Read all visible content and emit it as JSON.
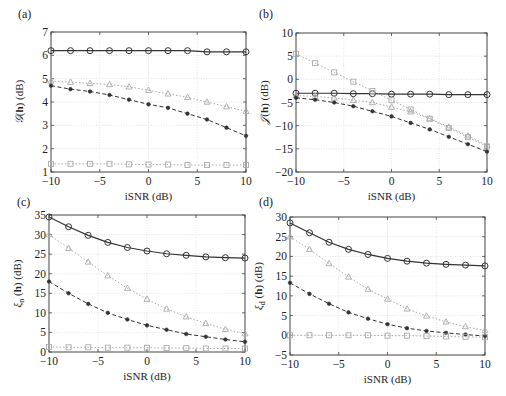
{
  "figure": {
    "panels": [
      "(a)",
      "(b)",
      "(c)",
      "(d)"
    ]
  },
  "chart_data": [
    {
      "panel": "(a)",
      "type": "line",
      "title": "",
      "xlabel": "iSNR (dB)",
      "ylabel": "𝒢(h) (dB)",
      "ylabel_math": {
        "sym": "𝒢",
        "arg": "h",
        "sub": ""
      },
      "x": [
        -10,
        -8,
        -6,
        -4,
        -2,
        0,
        2,
        4,
        6,
        8,
        10
      ],
      "xlim": [
        -10,
        10
      ],
      "ylim": [
        1,
        7
      ],
      "xticks": [
        -10,
        -5,
        0,
        5,
        10
      ],
      "yticks": [
        1,
        2,
        3,
        4,
        5,
        6,
        7
      ],
      "grid": true,
      "legend": null,
      "series": [
        {
          "name": "circles-solid",
          "marker": "circle",
          "line": "solid",
          "color": "#333333",
          "values": [
            6.2,
            6.2,
            6.2,
            6.2,
            6.2,
            6.2,
            6.2,
            6.2,
            6.15,
            6.15,
            6.15
          ]
        },
        {
          "name": "triangles-dotted",
          "marker": "triangle",
          "line": "dotted",
          "color": "#aaaaaa",
          "values": [
            4.9,
            4.85,
            4.8,
            4.75,
            4.65,
            4.5,
            4.35,
            4.2,
            4.0,
            3.8,
            3.6
          ]
        },
        {
          "name": "stars-dashed",
          "marker": "star",
          "line": "dashed",
          "color": "#333333",
          "values": [
            4.7,
            4.55,
            4.45,
            4.3,
            4.1,
            3.9,
            3.75,
            3.5,
            3.25,
            2.9,
            2.55
          ]
        },
        {
          "name": "squares-dotted",
          "marker": "square",
          "line": "dotted",
          "color": "#aaaaaa",
          "values": [
            1.35,
            1.35,
            1.35,
            1.35,
            1.33,
            1.32,
            1.32,
            1.3,
            1.3,
            1.3,
            1.3
          ]
        }
      ]
    },
    {
      "panel": "(b)",
      "type": "line",
      "title": "",
      "xlabel": "iSNR (dB)",
      "ylabel": "𝒥(h) (dB)",
      "ylabel_math": {
        "sym": "𝒥",
        "arg": "h",
        "sub": ""
      },
      "x": [
        -10,
        -8,
        -6,
        -4,
        -2,
        0,
        2,
        4,
        6,
        8,
        10
      ],
      "xlim": [
        -10,
        10
      ],
      "ylim": [
        -20,
        10
      ],
      "xticks": [
        -10,
        -5,
        0,
        5,
        10
      ],
      "yticks": [
        -20,
        -15,
        -10,
        -5,
        0,
        5,
        10
      ],
      "grid": true,
      "legend": null,
      "series": [
        {
          "name": "circles-solid",
          "marker": "circle",
          "line": "solid",
          "color": "#333333",
          "values": [
            -3.0,
            -3.0,
            -3.0,
            -3.1,
            -3.1,
            -3.2,
            -3.2,
            -3.2,
            -3.3,
            -3.3,
            -3.3
          ]
        },
        {
          "name": "triangles-dotted",
          "marker": "triangle",
          "line": "dotted",
          "color": "#aaaaaa",
          "values": [
            -3.5,
            -3.7,
            -4.0,
            -4.5,
            -5.0,
            -6.0,
            -7.0,
            -8.5,
            -10.3,
            -12.2,
            -14.2
          ]
        },
        {
          "name": "stars-dashed",
          "marker": "star",
          "line": "dashed",
          "color": "#333333",
          "values": [
            -4.0,
            -4.4,
            -5.0,
            -5.8,
            -6.9,
            -8.0,
            -9.4,
            -10.8,
            -12.4,
            -14.0,
            -15.6
          ]
        },
        {
          "name": "squares-dotted",
          "marker": "square",
          "line": "dotted",
          "color": "#aaaaaa",
          "values": [
            5.5,
            3.5,
            1.5,
            -0.5,
            -2.5,
            -4.5,
            -6.5,
            -8.5,
            -10.5,
            -12.5,
            -14.5
          ]
        }
      ]
    },
    {
      "panel": "(c)",
      "type": "line",
      "title": "",
      "xlabel": "iSNR (dB)",
      "ylabel": "ξn(h) (dB)",
      "ylabel_math": {
        "sym": "ξ",
        "arg": "h",
        "sub": "n"
      },
      "x": [
        -10,
        -8,
        -6,
        -4,
        -2,
        0,
        2,
        4,
        6,
        8,
        10
      ],
      "xlim": [
        -10,
        10
      ],
      "ylim": [
        0,
        35
      ],
      "xticks": [
        -10,
        -5,
        0,
        5,
        10
      ],
      "yticks": [
        0,
        5,
        10,
        15,
        20,
        25,
        30,
        35
      ],
      "grid": true,
      "legend": null,
      "series": [
        {
          "name": "circles-solid",
          "marker": "circle",
          "line": "solid",
          "color": "#333333",
          "values": [
            34.5,
            32.0,
            29.8,
            28.0,
            26.7,
            25.8,
            25.1,
            24.7,
            24.3,
            24.1,
            24.0
          ]
        },
        {
          "name": "triangles-dotted",
          "marker": "triangle",
          "line": "dotted",
          "color": "#aaaaaa",
          "values": [
            30.0,
            26.5,
            23.0,
            19.5,
            16.3,
            13.5,
            11.0,
            9.0,
            7.3,
            5.8,
            4.7
          ]
        },
        {
          "name": "stars-dashed",
          "marker": "star",
          "line": "dashed",
          "color": "#333333",
          "values": [
            18.0,
            15.0,
            12.3,
            10.0,
            8.3,
            6.8,
            5.7,
            4.6,
            3.9,
            3.2,
            2.6
          ]
        },
        {
          "name": "squares-dotted",
          "marker": "square",
          "line": "dotted",
          "color": "#aaaaaa",
          "values": [
            1.3,
            1.2,
            1.2,
            1.1,
            1.1,
            1.1,
            1.0,
            1.0,
            0.9,
            0.9,
            0.9
          ]
        }
      ]
    },
    {
      "panel": "(d)",
      "type": "line",
      "title": "",
      "xlabel": "iSNR (dB)",
      "ylabel": "ξd(h) (dB)",
      "ylabel_math": {
        "sym": "ξ",
        "arg": "h",
        "sub": "d"
      },
      "x": [
        -10,
        -8,
        -6,
        -4,
        -2,
        0,
        2,
        4,
        6,
        8,
        10
      ],
      "xlim": [
        -10,
        10
      ],
      "ylim": [
        -5,
        30
      ],
      "xticks": [
        -10,
        -5,
        0,
        5,
        10
      ],
      "yticks": [
        -5,
        0,
        5,
        10,
        15,
        20,
        25,
        30
      ],
      "grid": true,
      "legend": null,
      "series": [
        {
          "name": "circles-solid",
          "marker": "circle",
          "line": "solid",
          "color": "#333333",
          "values": [
            28.5,
            26.0,
            23.6,
            21.8,
            20.5,
            19.5,
            18.8,
            18.3,
            18.0,
            17.8,
            17.6
          ]
        },
        {
          "name": "triangles-dotted",
          "marker": "triangle",
          "line": "dotted",
          "color": "#aaaaaa",
          "values": [
            25.0,
            21.8,
            18.2,
            14.8,
            11.7,
            9.2,
            6.7,
            4.9,
            3.4,
            2.2,
            1.2
          ]
        },
        {
          "name": "stars-dashed",
          "marker": "star",
          "line": "dashed",
          "color": "#333333",
          "values": [
            13.3,
            10.5,
            8.0,
            5.8,
            4.2,
            2.8,
            1.8,
            1.1,
            0.6,
            0.2,
            -0.2
          ]
        },
        {
          "name": "squares-dotted",
          "marker": "square",
          "line": "dotted",
          "color": "#aaaaaa",
          "values": [
            0.0,
            0.0,
            0.0,
            0.0,
            0.0,
            -0.1,
            -0.1,
            -0.2,
            -0.3,
            -0.4,
            -0.5
          ]
        }
      ]
    }
  ]
}
